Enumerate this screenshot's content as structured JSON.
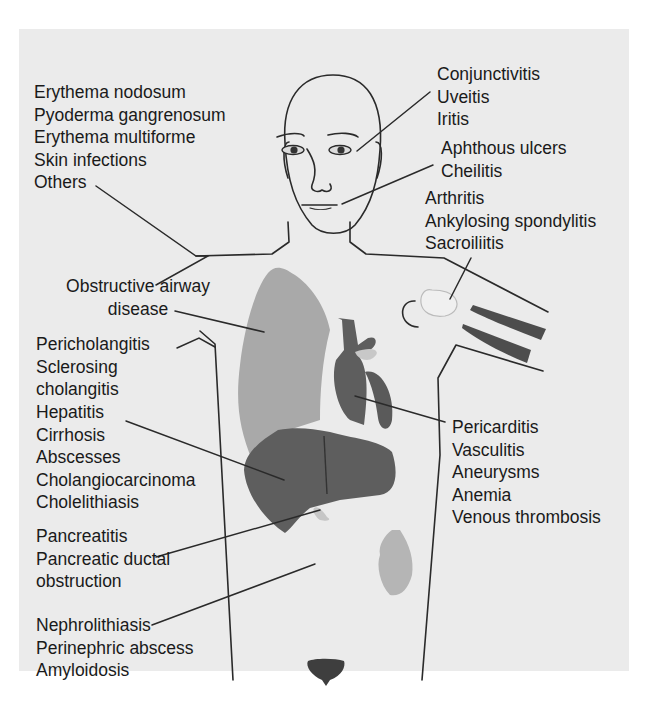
{
  "diagram": {
    "colors": {
      "background": "#ebebeb",
      "line": "#2a2a2a",
      "lung": "#a9a9a9",
      "heart": "#5a5a5a",
      "liver": "#5e5e5e",
      "kidney": "#b5b5b5",
      "bladder": "#3e3e3e"
    },
    "groups": {
      "skin": {
        "organ": "skin",
        "items": [
          "Erythema nodosum",
          "Pyoderma gangrenosum",
          "Erythema multiforme",
          "Skin infections",
          "Others"
        ]
      },
      "eye": {
        "organ": "eye",
        "items": [
          "Conjunctivitis",
          "Uveitis",
          "Iritis"
        ]
      },
      "mouth": {
        "organ": "mouth",
        "items": [
          "Aphthous ulcers",
          "Cheilitis"
        ]
      },
      "joint": {
        "organ": "joint",
        "items": [
          "Arthritis",
          "Ankylosing spondylitis",
          "Sacroiliitis"
        ]
      },
      "lung": {
        "organ": "lung",
        "items": [
          "Obstructive airway",
          "disease"
        ]
      },
      "biliary": {
        "organ": "biliary tract",
        "items": [
          "Pericholangitis",
          "Sclerosing",
          "cholangitis"
        ]
      },
      "liver": {
        "organ": "liver",
        "items": [
          "Hepatitis",
          "Cirrhosis",
          "Abscesses",
          "Cholangiocarcinoma",
          "Cholelithiasis"
        ]
      },
      "heart": {
        "organ": "heart / vascular",
        "items": [
          "Pericarditis",
          "Vasculitis",
          "Aneurysms",
          "Anemia",
          "Venous thrombosis"
        ]
      },
      "pancreas": {
        "organ": "pancreas",
        "items": [
          "Pancreatitis",
          "Pancreatic ductal",
          "obstruction"
        ]
      },
      "kidney": {
        "organ": "kidney",
        "items": [
          "Nephrolithiasis",
          "Perinephric abscess",
          "Amyloidosis"
        ]
      }
    }
  }
}
